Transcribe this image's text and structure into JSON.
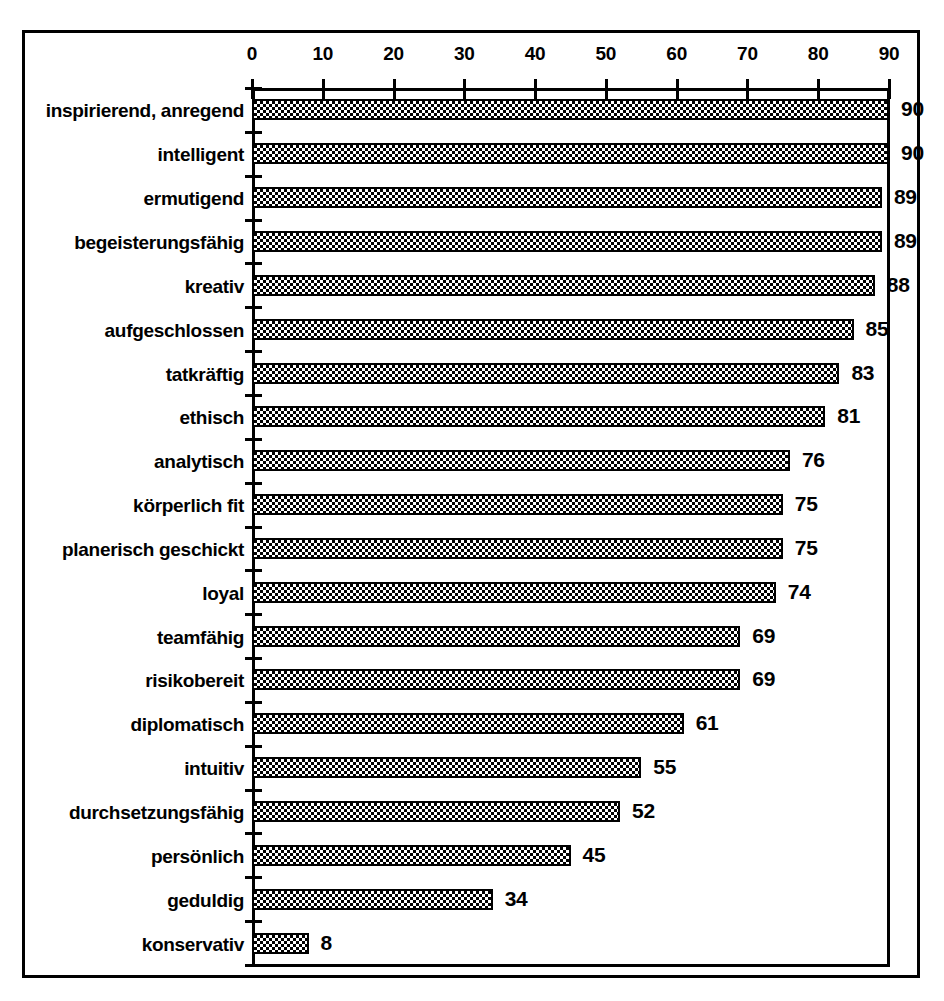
{
  "chart_data": {
    "type": "bar",
    "orientation": "horizontal",
    "title": "",
    "subtitle": "",
    "xlabel": "",
    "ylabel": "",
    "xlim": [
      0,
      90
    ],
    "xticks": [
      0,
      10,
      20,
      30,
      40,
      50,
      60,
      70,
      80,
      90
    ],
    "xtick_labels": [
      "0",
      "10",
      "20",
      "30",
      "40",
      "50",
      "60",
      "70",
      "80",
      "90"
    ],
    "grid": false,
    "legend": null,
    "bar_fill": "checkerboard-black-white",
    "categories": [
      "inspirierend, anregend",
      "intelligent",
      "ermutigend",
      "begeisterungsfähig",
      "kreativ",
      "aufgeschlossen",
      "tatkräftig",
      "ethisch",
      "analytisch",
      "körperlich fit",
      "planerisch geschickt",
      "loyal",
      "teamfähig",
      "risikobereit",
      "diplomatisch",
      "intuitiv",
      "durchsetzungsfähig",
      "persönlich",
      "geduldig",
      "konservativ"
    ],
    "values": [
      90,
      90,
      89,
      89,
      88,
      85,
      83,
      81,
      76,
      75,
      75,
      74,
      69,
      69,
      61,
      55,
      52,
      45,
      34,
      8
    ],
    "value_labels": [
      "90",
      "90",
      "89",
      "89",
      "88",
      "85",
      "83",
      "81",
      "76",
      "75",
      "75",
      "74",
      "69",
      "69",
      "61",
      "55",
      "52",
      "45",
      "34",
      "8"
    ]
  },
  "colors": {
    "foreground": "#000000",
    "background": "#ffffff"
  }
}
